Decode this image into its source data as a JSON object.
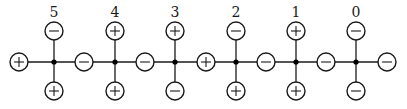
{
  "diagram": {
    "type": "charge-chain",
    "wire_y": 62,
    "node_radius": 9,
    "top_y": 31,
    "bottom_y": 91,
    "label_y": 17,
    "junctions": [
      {
        "label": "5",
        "x": 54,
        "top": "-",
        "bottom": "+"
      },
      {
        "label": "4",
        "x": 115,
        "top": "+",
        "bottom": "+"
      },
      {
        "label": "3",
        "x": 175,
        "top": "+",
        "bottom": "-"
      },
      {
        "label": "2",
        "x": 236,
        "top": "-",
        "bottom": "+"
      },
      {
        "label": "1",
        "x": 296,
        "top": "+",
        "bottom": "+"
      },
      {
        "label": "0",
        "x": 356,
        "top": "-",
        "bottom": "-"
      }
    ],
    "chain_nodes": [
      {
        "x": 19,
        "sign": "+"
      },
      {
        "x": 84,
        "sign": "-"
      },
      {
        "x": 145,
        "sign": "-"
      },
      {
        "x": 206,
        "sign": "+"
      },
      {
        "x": 266,
        "sign": "-"
      },
      {
        "x": 326,
        "sign": "-"
      },
      {
        "x": 387,
        "sign": "-"
      }
    ]
  }
}
